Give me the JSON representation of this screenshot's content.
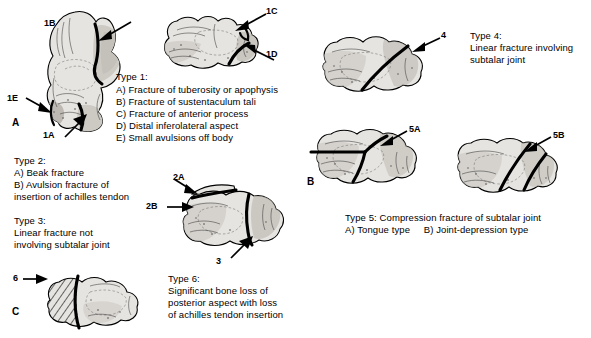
{
  "figure": {
    "background_color": "#ffffff",
    "bone_fill_color": "#e6e4e0",
    "line_color": "#000000"
  },
  "panels": [
    {
      "id": "panel-a",
      "letter": "A"
    },
    {
      "id": "panel-b",
      "letter": "B"
    },
    {
      "id": "panel-c",
      "letter": "C"
    }
  ],
  "type1": {
    "heading": "Type 1:",
    "items": [
      "A) Fracture of tuberosity or apophysis",
      "B) Fracture of sustentaculum tali",
      "C) Fracture of anterior process",
      "D) Distal inferolateral aspect",
      "E) Small avulsions off body"
    ]
  },
  "type2": {
    "heading": "Type 2:",
    "items": [
      "A) Beak fracture",
      "B) Avulsion fracture of",
      "insertion of achilles tendon"
    ]
  },
  "type3": {
    "heading": "Type 3:",
    "items": [
      "Linear fracture not",
      "involving subtalar joint"
    ]
  },
  "type4": {
    "heading": "Type 4:",
    "items": [
      "Linear fracture involving",
      "subtalar joint"
    ]
  },
  "type5": {
    "caption": "Type 5: Compression fracture of subtalar joint",
    "subtypes": "A) Tongue type     B) Joint-depression type"
  },
  "type6": {
    "heading": "Type 6:",
    "items": [
      "Significant bone loss of",
      "posterior aspect with loss",
      "of achilles tendon insertion"
    ]
  },
  "callouts": [
    {
      "id": "callout-1a",
      "label": "1A"
    },
    {
      "id": "callout-1b",
      "label": "1B"
    },
    {
      "id": "callout-1c",
      "label": "1C"
    },
    {
      "id": "callout-1d",
      "label": "1D"
    },
    {
      "id": "callout-1e",
      "label": "1E"
    },
    {
      "id": "callout-2a",
      "label": "2A"
    },
    {
      "id": "callout-2b",
      "label": "2B"
    },
    {
      "id": "callout-3",
      "label": "3"
    },
    {
      "id": "callout-4",
      "label": "4"
    },
    {
      "id": "callout-5a",
      "label": "5A"
    },
    {
      "id": "callout-5b",
      "label": "5B"
    },
    {
      "id": "callout-6",
      "label": "6"
    }
  ]
}
